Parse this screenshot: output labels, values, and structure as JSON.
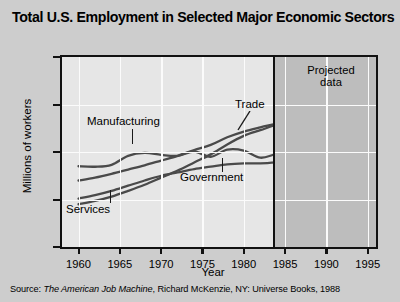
{
  "chart_data": {
    "type": "line",
    "title": "Total U.S. Employment in Selected Major Economic Sectors",
    "xlabel": "Year",
    "ylabel": "Millions of workers",
    "xlim": [
      1958,
      1996
    ],
    "ylim": [
      0,
      40
    ],
    "yticks": [
      0,
      10,
      20,
      30,
      40
    ],
    "xticks": [
      1960,
      1965,
      1970,
      1975,
      1980,
      1985,
      1990,
      1995
    ],
    "grid": true,
    "legend_position": "inline-annotations",
    "projection": {
      "label": "Projected data",
      "start_year": 1983.5,
      "band_color": "#bdbdbd"
    },
    "line_color": "#4a4a4a",
    "x": [
      1960,
      1962,
      1964,
      1966,
      1968,
      1970,
      1972,
      1974,
      1976,
      1978,
      1980,
      1982,
      1984,
      1986,
      1988,
      1990,
      1992,
      1995
    ],
    "series": [
      {
        "name": "Manufacturing",
        "values": [
          17.0,
          16.9,
          17.3,
          19.2,
          19.8,
          19.4,
          19.2,
          20.1,
          19.0,
          20.5,
          20.3,
          18.8,
          19.6,
          19.9,
          20.6,
          21.1,
          21.6,
          22.4
        ]
      },
      {
        "name": "Trade",
        "values": [
          14.0,
          14.6,
          15.4,
          16.3,
          17.2,
          18.2,
          19.2,
          20.4,
          21.5,
          23.1,
          24.3,
          25.2,
          26.0,
          26.9,
          27.8,
          28.6,
          29.3,
          30.4
        ]
      },
      {
        "name": "Government",
        "values": [
          10.2,
          10.9,
          11.8,
          12.9,
          14.0,
          15.0,
          15.7,
          16.4,
          16.9,
          17.4,
          17.6,
          17.6,
          17.8,
          18.1,
          18.4,
          18.7,
          19.0,
          19.4
        ]
      },
      {
        "name": "Services",
        "values": [
          9.0,
          9.7,
          10.6,
          11.8,
          13.1,
          14.6,
          16.1,
          17.8,
          19.5,
          21.6,
          23.4,
          24.6,
          25.8,
          27.1,
          28.4,
          29.7,
          30.8,
          32.9
        ]
      }
    ]
  },
  "labels": {
    "manufacturing": "Manufacturing",
    "trade": "Trade",
    "government": "Government",
    "services": "Services",
    "projected_line1": "Projected",
    "projected_line2": "data"
  },
  "source": {
    "prefix": "Source: ",
    "book_title": "The American Job Machine",
    "suffix": ", Richard McKenzie, NY: Universe Books, 1988"
  }
}
